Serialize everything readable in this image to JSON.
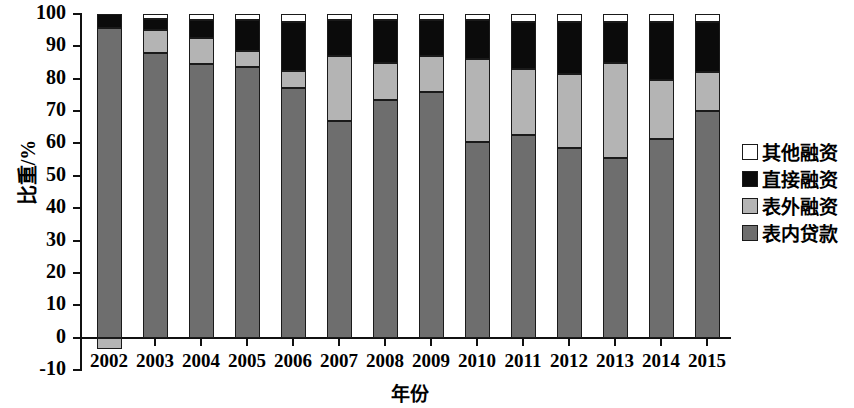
{
  "chart_data": {
    "type": "bar",
    "stacked": true,
    "title": "",
    "xlabel": "年份",
    "ylabel": "比重/%",
    "ylim": [
      -10,
      100
    ],
    "yticks": [
      100,
      90,
      80,
      70,
      60,
      50,
      40,
      30,
      20,
      10,
      0,
      -10
    ],
    "ytick_labels": [
      "100",
      "90",
      "80",
      "70",
      "60",
      "50",
      "40",
      "30",
      "20",
      "10",
      "0",
      "-10"
    ],
    "grid": false,
    "legend_position": "right",
    "categories": [
      "2002",
      "2003",
      "2004",
      "2005",
      "2006",
      "2007",
      "2008",
      "2009",
      "2010",
      "2011",
      "2012",
      "2013",
      "2014",
      "2015"
    ],
    "series": [
      {
        "name": "表内贷款",
        "color": "#6e6e6e",
        "values": [
          95.7,
          88.0,
          84.5,
          83.5,
          77.0,
          67.0,
          73.5,
          76.0,
          60.5,
          62.5,
          58.5,
          55.5,
          61.5,
          70.0
        ]
      },
      {
        "name": "表外融资",
        "color": "#b4b4b4",
        "values": [
          -3.5,
          7.0,
          8.0,
          5.0,
          5.5,
          20.0,
          11.5,
          11.0,
          25.5,
          20.5,
          23.0,
          29.5,
          18.0,
          12.0
        ]
      },
      {
        "name": "直接融资",
        "color": "#0b0b0b",
        "values": [
          4.3,
          3.5,
          5.5,
          9.5,
          15.0,
          11.0,
          13.0,
          11.0,
          12.0,
          14.5,
          16.0,
          12.5,
          18.0,
          15.5
        ]
      },
      {
        "name": "其他融资",
        "color": "#ffffff",
        "values": [
          0.0,
          1.5,
          2.0,
          2.0,
          2.5,
          2.0,
          2.0,
          2.0,
          2.0,
          2.5,
          2.5,
          2.5,
          2.5,
          2.5
        ]
      }
    ]
  },
  "legend": {
    "items": [
      {
        "label": "其他融资",
        "swatch": "white-swatch-icon"
      },
      {
        "label": "直接融资",
        "swatch": "black-swatch-icon"
      },
      {
        "label": "表外融资",
        "swatch": "lightgray-swatch-icon"
      },
      {
        "label": "表内贷款",
        "swatch": "darkgray-swatch-icon"
      }
    ]
  }
}
